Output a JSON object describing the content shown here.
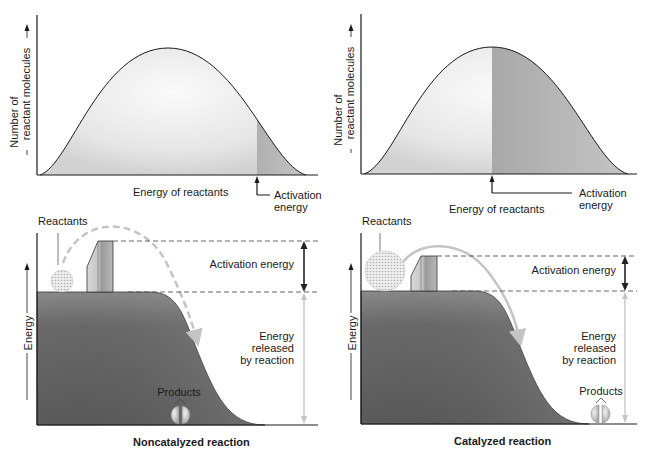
{
  "top_left": {
    "ylabel_line1": "Number of",
    "ylabel_line2": "reactant molecules",
    "xlabel": "Energy of reactants",
    "activation_line1": "Activation",
    "activation_line2": "energy"
  },
  "top_right": {
    "ylabel_line1": "Number of",
    "ylabel_line2": "reactant molecules",
    "xlabel": "Energy of reactants",
    "activation_line1": "Activation",
    "activation_line2": "energy"
  },
  "bottom_left": {
    "title": "Noncatalyzed reaction",
    "reactants_label": "Reactants",
    "ylabel": "Energy",
    "activation_energy_label": "Activation energy",
    "released_line1": "Energy",
    "released_line2": "released",
    "released_line3": "by reaction",
    "products_label": "Products"
  },
  "bottom_right": {
    "title": "Catalyzed reaction",
    "reactants_label": "Reactants",
    "ylabel": "Energy",
    "activation_energy_label": "Activation energy",
    "released_line1": "Energy",
    "released_line2": "released",
    "released_line3": "by reaction",
    "products_label": "Products"
  },
  "colors": {
    "curve_fill_light": "#e8e8e8",
    "activation_shade": "#b8b8b8",
    "hill_dark": "#6e6e6e",
    "axis": "#1a1a1a",
    "dashed": "#555555",
    "arrow_light": "#c8c8c8"
  }
}
